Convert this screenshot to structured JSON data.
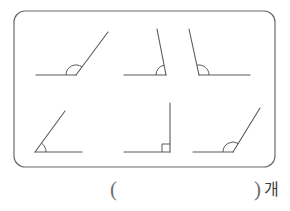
{
  "page": {
    "background_color": "#ffffff",
    "stroke_color": "#5a5a5a",
    "border_color": "#6b6b6b"
  },
  "frame": {
    "x": 14,
    "y": 11,
    "width": 261,
    "height": 156,
    "corner_radius": 11,
    "stroke_width": 1.2
  },
  "answer": {
    "paren_open": "(",
    "paren_close": ")",
    "unit": "개",
    "value": ""
  },
  "figures": [
    {
      "id": "angle-1",
      "name": "obtuse-angle-opening-right",
      "classification": "obtuse",
      "approx_degrees": 125,
      "vertex": {
        "x": 76,
        "y": 75
      },
      "ray_a": {
        "x": 36,
        "y": 75
      },
      "ray_b": {
        "x": 108,
        "y": 32
      },
      "marker": {
        "type": "arc",
        "radius": 10
      }
    },
    {
      "id": "angle-2",
      "name": "obtuse-angle-steep-right",
      "classification": "obtuse",
      "approx_degrees": 103,
      "vertex": {
        "x": 166,
        "y": 75
      },
      "ray_a": {
        "x": 124,
        "y": 75
      },
      "ray_b": {
        "x": 157,
        "y": 29
      },
      "marker": {
        "type": "arc",
        "radius": 10
      }
    },
    {
      "id": "angle-3",
      "name": "obtuse-angle-opening-left",
      "classification": "obtuse",
      "approx_degrees": 108,
      "vertex": {
        "x": 199,
        "y": 75
      },
      "ray_a": {
        "x": 250,
        "y": 75
      },
      "ray_b": {
        "x": 189,
        "y": 29
      },
      "marker": {
        "type": "arc",
        "radius": 10
      }
    },
    {
      "id": "angle-4",
      "name": "acute-angle-opening-right",
      "classification": "acute",
      "approx_degrees": 50,
      "vertex": {
        "x": 35,
        "y": 152
      },
      "ray_a": {
        "x": 82,
        "y": 152
      },
      "ray_b": {
        "x": 65,
        "y": 111
      },
      "marker": {
        "type": "arc",
        "radius": 11
      }
    },
    {
      "id": "angle-5",
      "name": "right-angle",
      "classification": "right",
      "approx_degrees": 90,
      "vertex": {
        "x": 170,
        "y": 152
      },
      "ray_a": {
        "x": 124,
        "y": 152
      },
      "ray_b": {
        "x": 170,
        "y": 103
      },
      "marker": {
        "type": "square",
        "size": 8
      }
    },
    {
      "id": "angle-6",
      "name": "obtuse-angle-opening-right-wide",
      "classification": "obtuse",
      "approx_degrees": 118,
      "vertex": {
        "x": 233,
        "y": 152
      },
      "ray_a": {
        "x": 193,
        "y": 152
      },
      "ray_b": {
        "x": 260,
        "y": 108
      },
      "marker": {
        "type": "arc",
        "radius": 10
      }
    }
  ]
}
